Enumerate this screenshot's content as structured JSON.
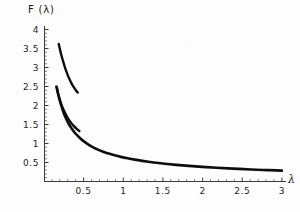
{
  "chart_data": {
    "type": "line",
    "title": "",
    "xlabel": "λ",
    "ylabel": "F (λ)",
    "xlim": [
      0,
      3.05
    ],
    "ylim": [
      0,
      4
    ],
    "grid": false,
    "legend": "none",
    "background_color": "#fdfdfd",
    "curve_color": "#111111",
    "axis_color": "#3a3a3a",
    "xticks": [
      0.5,
      1,
      1.5,
      2,
      2.5,
      3
    ],
    "xtick_labels": [
      "0.5",
      "1",
      "1.5",
      "2",
      "2.5",
      "3"
    ],
    "yticks": [
      0.5,
      1,
      1.5,
      2,
      2.5,
      3,
      3.5,
      4
    ],
    "ytick_labels": [
      "0.5",
      "1",
      "1.5",
      "2",
      "2.5",
      "3",
      "3.5",
      "4"
    ],
    "xminor_step": 0.1,
    "yminor_step": 0.1,
    "series": [
      {
        "name": "upper-branch",
        "points": [
          [
            0.18,
            3.62
          ],
          [
            0.195,
            3.48
          ],
          [
            0.21,
            3.35
          ],
          [
            0.23,
            3.2
          ],
          [
            0.25,
            3.06
          ],
          [
            0.27,
            2.93
          ],
          [
            0.29,
            2.82
          ],
          [
            0.31,
            2.72
          ],
          [
            0.33,
            2.63
          ],
          [
            0.355,
            2.53
          ],
          [
            0.38,
            2.45
          ],
          [
            0.4,
            2.39
          ],
          [
            0.42,
            2.34
          ]
        ]
      },
      {
        "name": "lower-branch",
        "points": [
          [
            0.15,
            2.5
          ],
          [
            0.165,
            2.37
          ],
          [
            0.18,
            2.25
          ],
          [
            0.2,
            2.11
          ],
          [
            0.22,
            1.99
          ],
          [
            0.245,
            1.87
          ],
          [
            0.27,
            1.76
          ],
          [
            0.3,
            1.65
          ],
          [
            0.33,
            1.56
          ],
          [
            0.365,
            1.47
          ],
          [
            0.4,
            1.4
          ],
          [
            0.44,
            1.33
          ]
        ]
      },
      {
        "name": "main-asymptotic-branch",
        "points": [
          [
            0.155,
            2.48
          ],
          [
            0.175,
            2.28
          ],
          [
            0.2,
            2.08
          ],
          [
            0.225,
            1.91
          ],
          [
            0.25,
            1.76
          ],
          [
            0.28,
            1.62
          ],
          [
            0.31,
            1.5
          ],
          [
            0.345,
            1.39
          ],
          [
            0.38,
            1.29
          ],
          [
            0.42,
            1.2
          ],
          [
            0.465,
            1.11
          ],
          [
            0.51,
            1.035
          ],
          [
            0.56,
            0.965
          ],
          [
            0.615,
            0.9
          ],
          [
            0.675,
            0.84
          ],
          [
            0.74,
            0.785
          ],
          [
            0.81,
            0.735
          ],
          [
            0.885,
            0.69
          ],
          [
            0.965,
            0.648
          ],
          [
            1.05,
            0.61
          ],
          [
            1.14,
            0.575
          ],
          [
            1.235,
            0.543
          ],
          [
            1.335,
            0.513
          ],
          [
            1.44,
            0.486
          ],
          [
            1.55,
            0.461
          ],
          [
            1.665,
            0.438
          ],
          [
            1.785,
            0.417
          ],
          [
            1.91,
            0.397
          ],
          [
            2.04,
            0.379
          ],
          [
            2.175,
            0.362
          ],
          [
            2.315,
            0.346
          ],
          [
            2.46,
            0.331
          ],
          [
            2.61,
            0.317
          ],
          [
            2.765,
            0.304
          ],
          [
            2.925,
            0.292
          ],
          [
            3.0,
            0.286
          ]
        ]
      }
    ],
    "annotations": []
  },
  "axes": {
    "y_axis_title": "F (λ)",
    "x_axis_title": "λ"
  }
}
